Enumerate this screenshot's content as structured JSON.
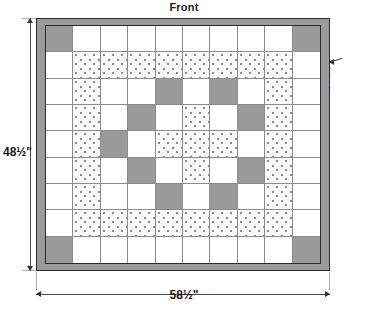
{
  "title": "Front",
  "labels": {
    "binding": "Binding",
    "height_dimension": "48½\"",
    "width_dimension": "58½\""
  },
  "colors": {
    "binding_gray": "#9a9a9a",
    "patch_gray": "#9a9a9a",
    "patch_white": "#ffffff",
    "patch_dotted_base": "#fbfbfb",
    "dot_color": "#8a8a8a",
    "grid_line": "#8c8c8c",
    "frame_line": "#2b2b2b",
    "text": "#1a1a1a"
  },
  "quilt": {
    "columns": 10,
    "rows": 9,
    "legend": {
      "w": "white solid patch",
      "g": "gray solid patch",
      "d": "dotted print patch"
    },
    "grid": [
      [
        "g",
        "w",
        "w",
        "w",
        "w",
        "w",
        "w",
        "w",
        "w",
        "g"
      ],
      [
        "w",
        "d",
        "d",
        "d",
        "d",
        "d",
        "d",
        "d",
        "d",
        "w"
      ],
      [
        "w",
        "d",
        "w",
        "w",
        "g",
        "w",
        "g",
        "w",
        "d",
        "w"
      ],
      [
        "w",
        "d",
        "w",
        "g",
        "w",
        "d",
        "w",
        "g",
        "d",
        "w"
      ],
      [
        "w",
        "d",
        "g",
        "w",
        "d",
        "d",
        "d",
        "w",
        "d",
        "w"
      ],
      [
        "w",
        "d",
        "w",
        "g",
        "w",
        "d",
        "w",
        "g",
        "d",
        "w"
      ],
      [
        "w",
        "d",
        "w",
        "w",
        "g",
        "w",
        "g",
        "w",
        "d",
        "w"
      ],
      [
        "w",
        "d",
        "d",
        "d",
        "d",
        "d",
        "d",
        "d",
        "d",
        "w"
      ],
      [
        "g",
        "w",
        "w",
        "w",
        "w",
        "w",
        "w",
        "w",
        "w",
        "g"
      ]
    ]
  }
}
